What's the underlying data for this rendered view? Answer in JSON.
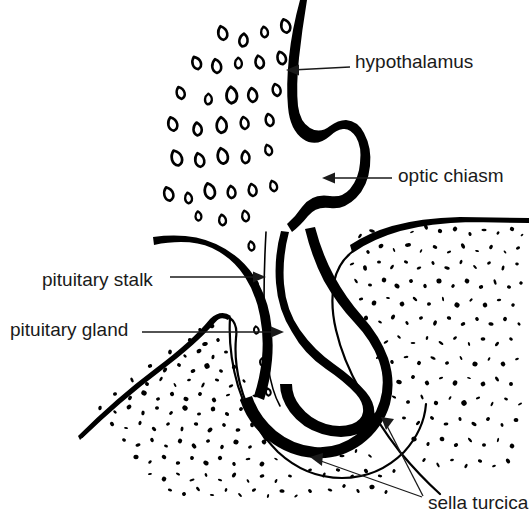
{
  "figure": {
    "background_color": "#ffffff",
    "ink_color": "#000000",
    "text_color": "#1a1a1a",
    "width": 529,
    "height": 519
  },
  "labels": [
    {
      "id": "hypothalamus",
      "text": "hypothalamus",
      "text_x": 355,
      "text_y": 63,
      "anchor": "start",
      "leader": "M 350 67 L 292 70",
      "arrow_x": 286,
      "arrow_y": 70,
      "arrow_dir": "left"
    },
    {
      "id": "optic-chiasm",
      "text": "optic chiasm",
      "text_x": 398,
      "text_y": 177,
      "anchor": "start",
      "leader": "M 392 178 L 329 178",
      "arrow_x": 322,
      "arrow_y": 178,
      "arrow_dir": "left"
    },
    {
      "id": "pituitary-stalk",
      "text": "pituitary stalk",
      "text_x": 42,
      "text_y": 281,
      "anchor": "start",
      "leader": "M 170 277 L 259 277",
      "arrow_x": 266,
      "arrow_y": 277,
      "arrow_dir": "right"
    },
    {
      "id": "pituitary-gland",
      "text": "pituitary gland",
      "text_x": 10,
      "text_y": 331,
      "anchor": "start",
      "leader": "M 142 332 L 277 332",
      "arrow_x": 284,
      "arrow_y": 332,
      "arrow_dir": "right"
    },
    {
      "id": "sella-turcica",
      "text": "sella turcica",
      "text_x": 428,
      "text_y": 504,
      "anchor": "start",
      "leader": "M 423 496 L 386 424",
      "arrow_x": 381,
      "arrow_y": 417,
      "arrow_dir": "upleft"
    }
  ],
  "extra_leaders": [
    {
      "id": "sella-turcica-second",
      "for": "sella-turcica",
      "leader": "M 422 497 L 318 460",
      "arrow_x": 310,
      "arrow_y": 457,
      "arrow_dir": "upleft2"
    }
  ],
  "structures": [
    {
      "id": "hypothalamus-tissue",
      "name": "hypothalamus",
      "render": "comma-shaped cell marks"
    },
    {
      "id": "brain-base-outline",
      "name": "brain base / third ventricle floor",
      "render": "thick black contour"
    },
    {
      "id": "optic-chiasm-lobe",
      "name": "optic chiasm",
      "render": "rounded thick lobe"
    },
    {
      "id": "pituitary-stalk-shape",
      "name": "pituitary stalk (infundibulum)",
      "render": "thick descending band"
    },
    {
      "id": "pituitary-gland-shape",
      "name": "pituitary gland",
      "render": "thick J-shaped body"
    },
    {
      "id": "sella-turcica-bone-right",
      "name": "sella turcica bone (posterior)",
      "render": "stippled bone"
    },
    {
      "id": "sella-turcica-bone-left",
      "name": "sella turcica bone (anterior)",
      "render": "stippled bone"
    },
    {
      "id": "dural-outline",
      "name": "dural / bone floor line",
      "render": "thin outline"
    }
  ],
  "cell_marks": [
    [
      222,
      33,
      1.0,
      14,
      -12
    ],
    [
      243,
      40,
      1.0,
      13,
      8
    ],
    [
      264,
      32,
      0.9,
      12,
      -6
    ],
    [
      285,
      26,
      1.0,
      14,
      -14
    ],
    [
      196,
      63,
      1.0,
      13,
      -20
    ],
    [
      216,
      66,
      1.0,
      14,
      -8
    ],
    [
      238,
      63,
      0.9,
      12,
      2
    ],
    [
      259,
      62,
      1.0,
      13,
      -10
    ],
    [
      281,
      58,
      1.0,
      13,
      -16
    ],
    [
      180,
      93,
      0.95,
      13,
      -16
    ],
    [
      208,
      99,
      0.9,
      12,
      4
    ],
    [
      231,
      95,
      1.1,
      15,
      -2
    ],
    [
      252,
      95,
      1.0,
      14,
      -6
    ],
    [
      276,
      90,
      0.95,
      13,
      -12
    ],
    [
      172,
      124,
      1.0,
      14,
      -14
    ],
    [
      197,
      129,
      1.0,
      13,
      -4
    ],
    [
      221,
      125,
      1.05,
      15,
      0
    ],
    [
      244,
      123,
      0.95,
      13,
      -8
    ],
    [
      269,
      120,
      0.95,
      13,
      -10
    ],
    [
      176,
      158,
      1.05,
      15,
      -18
    ],
    [
      199,
      160,
      1.0,
      14,
      -12
    ],
    [
      222,
      156,
      1.05,
      15,
      -10
    ],
    [
      245,
      157,
      0.95,
      13,
      0
    ],
    [
      268,
      150,
      0.9,
      12,
      -14
    ],
    [
      168,
      194,
      1.0,
      14,
      -16
    ],
    [
      188,
      198,
      0.9,
      12,
      -6
    ],
    [
      209,
      191,
      1.05,
      15,
      -12
    ],
    [
      231,
      192,
      0.95,
      13,
      -4
    ],
    [
      252,
      190,
      0.95,
      13,
      -8
    ],
    [
      273,
      186,
      0.9,
      12,
      -14
    ],
    [
      198,
      216,
      0.85,
      11,
      -4
    ],
    [
      222,
      220,
      0.9,
      12,
      -6
    ],
    [
      245,
      216,
      0.9,
      12,
      -10
    ],
    [
      251,
      246,
      0.85,
      11,
      -8
    ],
    [
      255,
      284,
      0.8,
      10,
      -6
    ],
    [
      256,
      330,
      0.75,
      10,
      -4
    ],
    [
      262,
      362,
      0.75,
      10,
      -2
    ],
    [
      268,
      392,
      0.75,
      10,
      -6
    ]
  ],
  "stipple_right": [
    [
      360,
      236,
      2.5
    ],
    [
      372,
      231,
      3.0
    ],
    [
      385,
      233,
      2.2
    ],
    [
      398,
      228,
      2.6
    ],
    [
      412,
      232,
      2.0
    ],
    [
      426,
      227,
      2.8
    ],
    [
      440,
      231,
      2.2
    ],
    [
      455,
      229,
      2.4
    ],
    [
      470,
      234,
      2.0
    ],
    [
      484,
      230,
      2.6
    ],
    [
      498,
      233,
      1.8
    ],
    [
      512,
      229,
      2.2
    ],
    [
      522,
      235,
      1.6
    ],
    [
      355,
      248,
      2.8
    ],
    [
      368,
      252,
      2.0
    ],
    [
      381,
      246,
      2.6
    ],
    [
      394,
      250,
      2.2
    ],
    [
      408,
      245,
      3.0
    ],
    [
      421,
      251,
      2.0
    ],
    [
      435,
      247,
      2.4
    ],
    [
      449,
      252,
      2.2
    ],
    [
      463,
      246,
      2.8
    ],
    [
      477,
      251,
      2.0
    ],
    [
      491,
      247,
      2.4
    ],
    [
      505,
      252,
      1.8
    ],
    [
      518,
      248,
      2.2
    ],
    [
      352,
      264,
      2.4
    ],
    [
      365,
      268,
      2.8
    ],
    [
      379,
      262,
      2.0
    ],
    [
      392,
      267,
      2.6
    ],
    [
      406,
      262,
      2.2
    ],
    [
      419,
      268,
      2.4
    ],
    [
      433,
      263,
      2.0
    ],
    [
      447,
      268,
      2.8
    ],
    [
      461,
      262,
      2.2
    ],
    [
      475,
      267,
      2.4
    ],
    [
      489,
      263,
      2.0
    ],
    [
      503,
      268,
      2.6
    ],
    [
      517,
      264,
      1.8
    ],
    [
      356,
      281,
      2.6
    ],
    [
      370,
      285,
      2.0
    ],
    [
      384,
      280,
      2.4
    ],
    [
      397,
      286,
      2.8
    ],
    [
      411,
      281,
      2.0
    ],
    [
      425,
      286,
      2.2
    ],
    [
      439,
      281,
      2.6
    ],
    [
      453,
      286,
      2.0
    ],
    [
      467,
      281,
      2.4
    ],
    [
      481,
      287,
      2.2
    ],
    [
      495,
      282,
      2.8
    ],
    [
      509,
      287,
      2.0
    ],
    [
      521,
      283,
      1.8
    ],
    [
      361,
      299,
      2.2
    ],
    [
      374,
      303,
      2.6
    ],
    [
      388,
      298,
      2.0
    ],
    [
      402,
      304,
      2.4
    ],
    [
      415,
      299,
      2.8
    ],
    [
      429,
      304,
      2.0
    ],
    [
      443,
      299,
      2.2
    ],
    [
      457,
      305,
      2.6
    ],
    [
      471,
      300,
      2.0
    ],
    [
      485,
      305,
      2.4
    ],
    [
      499,
      300,
      2.2
    ],
    [
      513,
      305,
      1.8
    ],
    [
      366,
      318,
      2.4
    ],
    [
      380,
      322,
      2.0
    ],
    [
      393,
      317,
      2.6
    ],
    [
      407,
      323,
      2.2
    ],
    [
      421,
      318,
      2.0
    ],
    [
      435,
      323,
      2.8
    ],
    [
      449,
      318,
      2.2
    ],
    [
      463,
      324,
      2.4
    ],
    [
      477,
      319,
      2.0
    ],
    [
      491,
      324,
      2.6
    ],
    [
      505,
      319,
      2.2
    ],
    [
      519,
      324,
      1.8
    ],
    [
      372,
      337,
      2.0
    ],
    [
      386,
      342,
      2.6
    ],
    [
      399,
      337,
      2.2
    ],
    [
      413,
      343,
      2.4
    ],
    [
      427,
      338,
      2.0
    ],
    [
      441,
      343,
      2.8
    ],
    [
      455,
      338,
      2.2
    ],
    [
      469,
      344,
      2.0
    ],
    [
      483,
      339,
      2.4
    ],
    [
      497,
      344,
      2.6
    ],
    [
      511,
      339,
      2.0
    ],
    [
      378,
      357,
      2.6
    ],
    [
      392,
      362,
      2.0
    ],
    [
      406,
      357,
      2.4
    ],
    [
      419,
      363,
      2.2
    ],
    [
      433,
      358,
      2.8
    ],
    [
      447,
      363,
      2.0
    ],
    [
      461,
      358,
      2.2
    ],
    [
      475,
      364,
      2.6
    ],
    [
      489,
      359,
      2.0
    ],
    [
      503,
      364,
      2.4
    ],
    [
      517,
      359,
      2.0
    ],
    [
      386,
      377,
      2.2
    ],
    [
      399,
      382,
      2.8
    ],
    [
      413,
      377,
      2.0
    ],
    [
      427,
      383,
      2.4
    ],
    [
      441,
      378,
      2.2
    ],
    [
      455,
      383,
      2.6
    ],
    [
      469,
      378,
      2.0
    ],
    [
      483,
      384,
      2.4
    ],
    [
      497,
      379,
      2.8
    ],
    [
      511,
      384,
      2.0
    ],
    [
      394,
      397,
      2.4
    ],
    [
      408,
      402,
      2.0
    ],
    [
      422,
      397,
      2.6
    ],
    [
      436,
      403,
      2.2
    ],
    [
      450,
      398,
      2.0
    ],
    [
      464,
      403,
      2.8
    ],
    [
      478,
      398,
      2.2
    ],
    [
      492,
      404,
      2.4
    ],
    [
      506,
      399,
      2.0
    ],
    [
      520,
      404,
      2.2
    ],
    [
      404,
      418,
      2.0
    ],
    [
      418,
      423,
      2.6
    ],
    [
      432,
      418,
      2.2
    ],
    [
      446,
      424,
      2.4
    ],
    [
      460,
      419,
      2.0
    ],
    [
      474,
      424,
      2.8
    ],
    [
      488,
      419,
      2.2
    ],
    [
      502,
      425,
      2.0
    ],
    [
      516,
      420,
      2.4
    ],
    [
      414,
      439,
      2.6
    ],
    [
      428,
      444,
      2.0
    ],
    [
      442,
      439,
      2.4
    ],
    [
      456,
      445,
      2.2
    ],
    [
      470,
      440,
      2.8
    ],
    [
      484,
      445,
      2.0
    ],
    [
      498,
      440,
      2.2
    ],
    [
      512,
      446,
      2.4
    ],
    [
      424,
      460,
      2.2
    ],
    [
      438,
      465,
      2.6
    ],
    [
      452,
      460,
      2.0
    ],
    [
      466,
      466,
      2.4
    ],
    [
      480,
      461,
      2.2
    ],
    [
      494,
      466,
      2.0
    ],
    [
      508,
      461,
      2.6
    ]
  ],
  "stipple_left": [
    [
      200,
      330,
      2.0
    ],
    [
      212,
      326,
      2.4
    ],
    [
      190,
      340,
      2.2
    ],
    [
      205,
      344,
      2.8
    ],
    [
      218,
      340,
      2.0
    ],
    [
      170,
      352,
      2.4
    ],
    [
      185,
      356,
      2.0
    ],
    [
      199,
      351,
      2.6
    ],
    [
      213,
      357,
      2.2
    ],
    [
      226,
      352,
      2.0
    ],
    [
      150,
      366,
      2.2
    ],
    [
      165,
      370,
      2.6
    ],
    [
      179,
      365,
      2.0
    ],
    [
      193,
      371,
      2.4
    ],
    [
      207,
      366,
      2.8
    ],
    [
      221,
      371,
      2.0
    ],
    [
      234,
      367,
      2.2
    ],
    [
      132,
      380,
      2.6
    ],
    [
      147,
      384,
      2.0
    ],
    [
      161,
      379,
      2.4
    ],
    [
      175,
      385,
      2.2
    ],
    [
      189,
      380,
      2.0
    ],
    [
      203,
      385,
      2.8
    ],
    [
      217,
      380,
      2.2
    ],
    [
      231,
      386,
      2.4
    ],
    [
      244,
      381,
      2.0
    ],
    [
      115,
      394,
      2.0
    ],
    [
      130,
      398,
      2.4
    ],
    [
      144,
      393,
      2.8
    ],
    [
      158,
      399,
      2.0
    ],
    [
      172,
      394,
      2.2
    ],
    [
      186,
      399,
      2.6
    ],
    [
      200,
      394,
      2.0
    ],
    [
      214,
      400,
      2.4
    ],
    [
      228,
      395,
      2.2
    ],
    [
      242,
      400,
      2.0
    ],
    [
      255,
      396,
      2.6
    ],
    [
      100,
      408,
      2.2
    ],
    [
      115,
      412,
      2.0
    ],
    [
      129,
      407,
      2.6
    ],
    [
      143,
      413,
      2.4
    ],
    [
      157,
      408,
      2.0
    ],
    [
      171,
      413,
      2.2
    ],
    [
      185,
      408,
      2.8
    ],
    [
      199,
      414,
      2.0
    ],
    [
      213,
      409,
      2.4
    ],
    [
      227,
      414,
      2.2
    ],
    [
      241,
      409,
      2.0
    ],
    [
      255,
      415,
      2.6
    ],
    [
      112,
      424,
      2.4
    ],
    [
      126,
      428,
      2.0
    ],
    [
      140,
      423,
      2.2
    ],
    [
      154,
      429,
      2.6
    ],
    [
      168,
      424,
      2.0
    ],
    [
      182,
      429,
      2.4
    ],
    [
      196,
      424,
      2.2
    ],
    [
      210,
      430,
      2.8
    ],
    [
      224,
      425,
      2.0
    ],
    [
      238,
      430,
      2.4
    ],
    [
      252,
      425,
      2.2
    ],
    [
      124,
      440,
      2.0
    ],
    [
      138,
      445,
      2.6
    ],
    [
      152,
      440,
      2.2
    ],
    [
      166,
      446,
      2.0
    ],
    [
      180,
      441,
      2.4
    ],
    [
      194,
      446,
      2.8
    ],
    [
      208,
      441,
      2.0
    ],
    [
      222,
      447,
      2.2
    ],
    [
      236,
      442,
      2.6
    ],
    [
      250,
      447,
      2.0
    ],
    [
      264,
      442,
      2.4
    ],
    [
      136,
      457,
      2.6
    ],
    [
      150,
      462,
      2.0
    ],
    [
      164,
      457,
      2.4
    ],
    [
      178,
      463,
      2.2
    ],
    [
      192,
      458,
      2.0
    ],
    [
      206,
      463,
      2.8
    ],
    [
      220,
      458,
      2.2
    ],
    [
      234,
      464,
      2.0
    ],
    [
      248,
      459,
      2.4
    ],
    [
      262,
      464,
      2.6
    ],
    [
      276,
      459,
      2.0
    ],
    [
      150,
      474,
      2.0
    ],
    [
      164,
      479,
      2.4
    ],
    [
      178,
      474,
      2.2
    ],
    [
      192,
      480,
      2.6
    ],
    [
      206,
      475,
      2.0
    ],
    [
      220,
      480,
      2.2
    ],
    [
      234,
      475,
      2.8
    ],
    [
      248,
      481,
      2.0
    ],
    [
      262,
      476,
      2.4
    ],
    [
      276,
      481,
      2.2
    ],
    [
      290,
      476,
      2.0
    ],
    [
      170,
      490,
      2.2
    ],
    [
      184,
      494,
      2.0
    ],
    [
      198,
      489,
      2.6
    ],
    [
      212,
      495,
      2.2
    ],
    [
      226,
      490,
      2.0
    ],
    [
      240,
      495,
      2.4
    ],
    [
      254,
      490,
      2.2
    ],
    [
      268,
      496,
      2.0
    ],
    [
      282,
      491,
      2.6
    ],
    [
      296,
      496,
      2.0
    ],
    [
      310,
      491,
      2.2
    ],
    [
      300,
      450,
      2.2
    ],
    [
      314,
      455,
      2.0
    ],
    [
      328,
      450,
      2.4
    ],
    [
      342,
      456,
      2.6
    ],
    [
      356,
      451,
      2.0
    ],
    [
      370,
      456,
      2.2
    ],
    [
      310,
      470,
      2.0
    ],
    [
      324,
      475,
      2.6
    ],
    [
      338,
      470,
      2.2
    ],
    [
      352,
      476,
      2.0
    ],
    [
      366,
      471,
      2.4
    ],
    [
      380,
      476,
      2.2
    ],
    [
      394,
      471,
      2.0
    ],
    [
      330,
      490,
      2.4
    ],
    [
      344,
      486,
      2.0
    ],
    [
      358,
      491,
      2.2
    ],
    [
      372,
      487,
      2.6
    ],
    [
      386,
      492,
      2.0
    ]
  ]
}
